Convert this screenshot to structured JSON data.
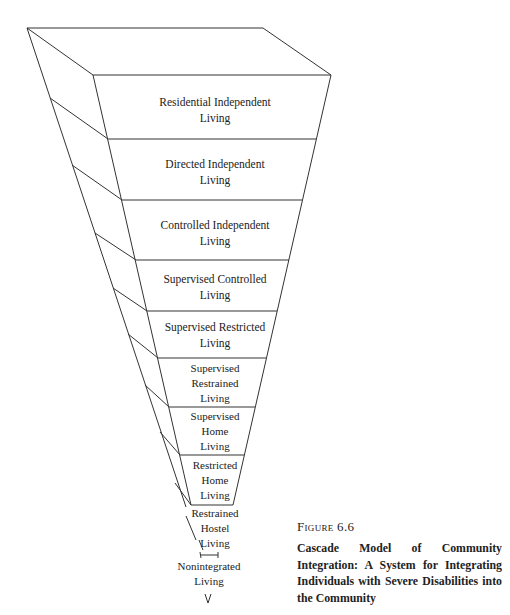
{
  "diagram": {
    "type": "inverted-cascade-funnel",
    "levels": [
      {
        "line1": "Residential Independent",
        "line2": "Living"
      },
      {
        "line1": "Directed Independent",
        "line2": "Living"
      },
      {
        "line1": "Controlled Independent",
        "line2": "Living"
      },
      {
        "line1": "Supervised Controlled",
        "line2": "Living"
      },
      {
        "line1": "Supervised Restricted",
        "line2": "Living"
      },
      {
        "line1": "Supervised",
        "line2": "Restrained",
        "line3": "Living"
      },
      {
        "line1": "Supervised",
        "line2": "Home",
        "line3": "Living"
      },
      {
        "line1": "Restricted",
        "line2": "Home",
        "line3": "Living"
      },
      {
        "line1": "Restrained",
        "line2": "Hostel",
        "line3": "Living"
      },
      {
        "line1": "Nonintegrated",
        "line2": "Living"
      }
    ]
  },
  "caption": {
    "figure_number": "Figure 6.6",
    "title": "Cascade Model of Community Integration: A System for Integrating Individuals with Severe Disabilities into the Community"
  }
}
